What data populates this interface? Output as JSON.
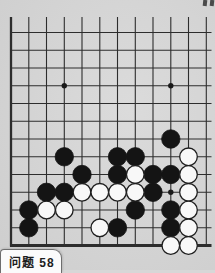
{
  "page": {
    "background_color": "#d7d7d7",
    "caption": {
      "label": "问题 58"
    },
    "scan_marks_color": "#4a4a4a"
  },
  "board": {
    "line_color": "#2d2d2d",
    "black_stone_color": "#141414",
    "white_stone_fill": "#f8f8f8",
    "white_stone_stroke": "#1e1e1e",
    "star_color": "#1a1a1a",
    "cols_x": [
      11,
      28.8,
      46.5,
      64.3,
      82,
      99.8,
      117.5,
      135.3,
      153,
      170.8,
      188.5,
      206.3
    ],
    "rows_y": [
      32.5,
      50.3,
      68,
      85.8,
      103.5,
      121.3,
      139,
      156.8,
      174.5,
      192.3,
      210,
      227.8,
      245.5
    ],
    "h_line_x_start": 10,
    "h_line_x_end": 211.5,
    "v_line_top": 17,
    "v_line_bottom": 246.5,
    "edge_thickness": {
      "left": 2.3,
      "bottom": 2.8,
      "normal": 1.1
    },
    "stone_radius": 9.2,
    "star_radius": 2.7,
    "star_points": [
      [
        4,
        4
      ],
      [
        10,
        4
      ],
      [
        10,
        10
      ]
    ],
    "stones": {
      "black": [
        [
          10,
          7
        ],
        [
          4,
          8
        ],
        [
          7,
          8
        ],
        [
          8,
          8
        ],
        [
          5,
          9
        ],
        [
          7,
          9
        ],
        [
          9,
          9
        ],
        [
          10,
          9
        ],
        [
          3,
          10
        ],
        [
          4,
          10
        ],
        [
          9,
          10
        ],
        [
          2,
          11
        ],
        [
          8,
          11
        ],
        [
          10,
          11
        ],
        [
          2,
          12
        ],
        [
          7,
          12
        ],
        [
          10,
          12
        ]
      ],
      "white": [
        [
          11,
          8
        ],
        [
          8,
          9
        ],
        [
          11,
          9
        ],
        [
          5,
          10
        ],
        [
          6,
          10
        ],
        [
          7,
          10
        ],
        [
          8,
          10
        ],
        [
          11,
          10
        ],
        [
          3,
          11
        ],
        [
          4,
          11
        ],
        [
          11,
          11
        ],
        [
          6,
          12
        ],
        [
          11,
          12
        ],
        [
          10,
          13
        ],
        [
          11,
          13
        ]
      ]
    }
  }
}
